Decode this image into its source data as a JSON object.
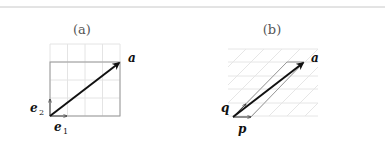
{
  "panels": [
    {
      "caption": "(a)",
      "vector_label": "a",
      "basis1_label": "e",
      "basis1_sub": "1",
      "basis2_label": "e",
      "basis2_sub": "2",
      "grid": "orthogonal 4x4"
    },
    {
      "caption": "(b)",
      "vector_label": "a",
      "basis1_label": "p",
      "basis2_label": "q",
      "grid": "skewed"
    }
  ],
  "colors": {
    "rule": "#c8c8c8",
    "grid": "#e4e4e4",
    "frame": "#999999",
    "vector": "#111111"
  }
}
